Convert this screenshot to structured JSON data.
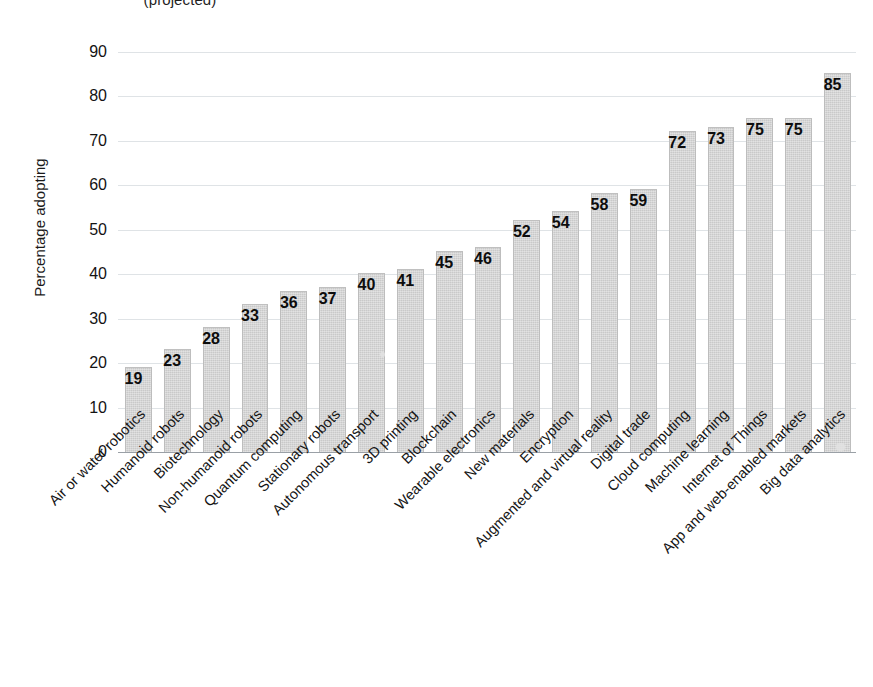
{
  "chart_data": {
    "type": "bar",
    "title": "(projected)",
    "xlabel": "",
    "ylabel": "Percentage adopting",
    "ylim": [
      0,
      90
    ],
    "ytick_step": 10,
    "yticks": [
      0,
      10,
      20,
      30,
      40,
      50,
      60,
      70,
      80,
      90
    ],
    "grid": true,
    "legend": false,
    "orientation": "vertical",
    "bar_color": "#c9c9c9",
    "categories": [
      "Air or water robotics",
      "Humanoid robots",
      "Biotechnology",
      "Non-humanoid robots",
      "Quantum computing",
      "Stationary robots",
      "Autonomous transport",
      "3D printing",
      "Blockchain",
      "Wearable electronics",
      "New materials",
      "Encryption",
      "Augmented and virtual reality",
      "Digital trade",
      "Cloud computing",
      "Machine learning",
      "Internet of Things",
      "App and web-enabled markets",
      "Big data analytics"
    ],
    "values": [
      19,
      23,
      28,
      33,
      36,
      37,
      40,
      41,
      45,
      46,
      52,
      54,
      58,
      59,
      72,
      73,
      75,
      75,
      85
    ],
    "value_labels": [
      "19",
      "23",
      "28",
      "33",
      "36",
      "37",
      "40",
      "41",
      "45",
      "46",
      "52",
      "54",
      "58",
      "59",
      "72",
      "73",
      "75",
      "75",
      "85"
    ]
  }
}
